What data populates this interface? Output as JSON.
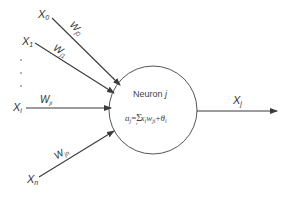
{
  "diagram": {
    "type": "neuron-model",
    "colors": {
      "stroke": "#3a3a3a",
      "text": "#333333",
      "background": "#ffffff"
    },
    "inputs": [
      {
        "label": "X",
        "sub": "0",
        "weight": "W",
        "weight_sub": "j0"
      },
      {
        "label": "X",
        "sub": "1",
        "weight": "W",
        "weight_sub": "j1"
      },
      {
        "label": "X",
        "sub": "i",
        "weight": "W",
        "weight_sub": "ji"
      },
      {
        "label": "X",
        "sub": "n",
        "weight": "W",
        "weight_sub": "jn"
      }
    ],
    "ellipsis": "⋮",
    "neuron": {
      "title": "Neuron j",
      "title_main": "Neuron ",
      "title_var": "j",
      "formula": "a_j = Σ_i x_i w_ji + θ_i",
      "formula_lhs": "a",
      "formula_lhs_sub": "j",
      "formula_eq": "=",
      "formula_sum": "Σ",
      "formula_sum_sub": "i",
      "formula_x": "x",
      "formula_x_sub": "i",
      "formula_w": "w",
      "formula_w_sub": "ji",
      "formula_plus": "+",
      "formula_theta": "θ",
      "formula_theta_sub": "i"
    },
    "output": {
      "label": "X",
      "sub": "j"
    }
  }
}
